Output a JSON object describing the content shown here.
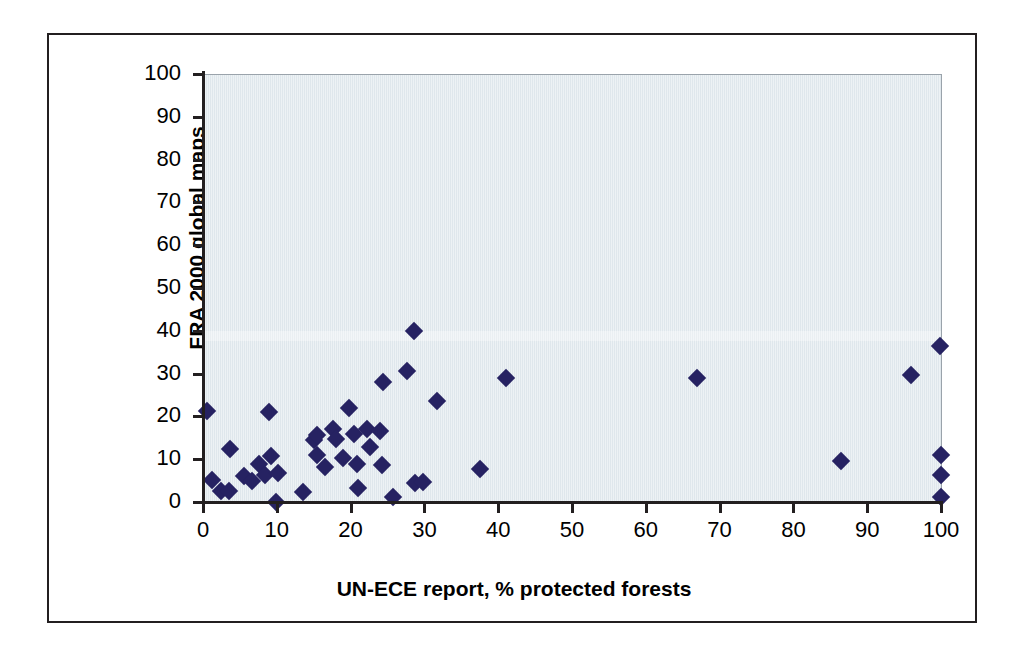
{
  "figure": {
    "background_color": "#ffffff",
    "frame_color": "#231f20",
    "plot_background_color": "#dfe7ec",
    "marker_color": "#262262"
  },
  "chart_data": {
    "type": "scatter",
    "title": "",
    "xlabel": "UN-ECE report, % protected forests",
    "ylabel": "FRA 2000 global maps\n% protected forests",
    "ylabel_line1": "FRA 2000 global maps",
    "ylabel_line2": "% protected forests",
    "xlim": [
      0,
      100
    ],
    "ylim": [
      0,
      100
    ],
    "xticks": [
      0,
      10,
      20,
      30,
      40,
      50,
      60,
      70,
      80,
      90,
      100
    ],
    "yticks": [
      0,
      10,
      20,
      30,
      40,
      50,
      60,
      70,
      80,
      90,
      100
    ],
    "xticklabels": [
      "0",
      "10",
      "20",
      "30",
      "40",
      "50",
      "60",
      "70",
      "80",
      "90",
      "100"
    ],
    "yticklabels": [
      "0",
      "10",
      "20",
      "30",
      "40",
      "50",
      "60",
      "70",
      "80",
      "90",
      "100"
    ],
    "grid": false,
    "legend": null,
    "marker": "diamond",
    "series": [
      {
        "name": "countries",
        "points": [
          [
            0.6,
            21.6
          ],
          [
            1.2,
            5.4
          ],
          [
            2.4,
            2.9
          ],
          [
            3.5,
            2.8
          ],
          [
            3.6,
            12.7
          ],
          [
            5.6,
            6.3
          ],
          [
            6.6,
            5.2
          ],
          [
            7.6,
            9.0
          ],
          [
            8.4,
            6.5
          ],
          [
            9.0,
            21.3
          ],
          [
            9.2,
            10.9
          ],
          [
            9.9,
            0.2
          ],
          [
            10.2,
            7.0
          ],
          [
            13.6,
            2.6
          ],
          [
            15.0,
            14.8
          ],
          [
            15.4,
            16.0
          ],
          [
            15.5,
            11.3
          ],
          [
            16.5,
            8.3
          ],
          [
            17.6,
            17.2
          ],
          [
            18.0,
            14.9
          ],
          [
            19.0,
            10.4
          ],
          [
            19.8,
            22.3
          ],
          [
            20.4,
            16.2
          ],
          [
            20.8,
            9.2
          ],
          [
            21.0,
            3.6
          ],
          [
            22.2,
            17.4
          ],
          [
            22.6,
            13.0
          ],
          [
            24.0,
            16.9
          ],
          [
            24.2,
            8.8
          ],
          [
            24.4,
            28.3
          ],
          [
            25.8,
            1.4
          ],
          [
            27.6,
            30.9
          ],
          [
            28.6,
            40.3
          ],
          [
            28.7,
            4.6
          ],
          [
            29.8,
            5.0
          ],
          [
            31.7,
            23.8
          ],
          [
            37.6,
            8.0
          ],
          [
            41.0,
            29.2
          ],
          [
            67.0,
            29.1
          ],
          [
            86.4,
            9.8
          ],
          [
            95.9,
            29.9
          ],
          [
            99.8,
            36.6
          ],
          [
            100.0,
            11.3
          ],
          [
            100.0,
            6.6
          ],
          [
            100.0,
            1.3
          ]
        ]
      }
    ]
  }
}
